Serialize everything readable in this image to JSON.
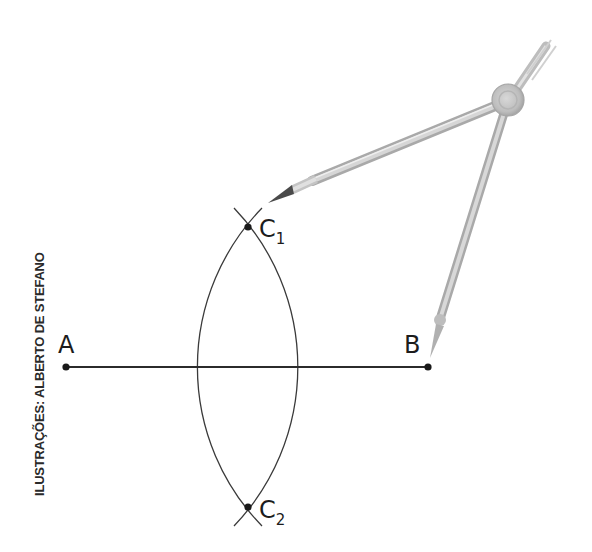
{
  "diagram": {
    "type": "geometric-construction",
    "credit": "ILUSTRAÇÕES: ALBERTO DE STEFANO",
    "colors": {
      "background": "#ffffff",
      "line": "#2b2b2b",
      "arc": "#3a3a3a",
      "point": "#1a1a1a",
      "compass_metal": "#c9c9c9",
      "compass_dark": "#9a9a9a",
      "pencil_lead": "#444444"
    },
    "points": [
      {
        "id": "A",
        "label": "A",
        "subscript": "",
        "x": 66,
        "y": 367
      },
      {
        "id": "B",
        "label": "B",
        "subscript": "",
        "x": 428,
        "y": 367
      },
      {
        "id": "C1",
        "label": "C",
        "subscript": "1",
        "x": 248,
        "y": 227
      },
      {
        "id": "C2",
        "label": "C",
        "subscript": "2",
        "x": 248,
        "y": 507
      }
    ],
    "segment": {
      "from": "A",
      "to": "B"
    },
    "arcs": [
      {
        "center": "A",
        "radius": 230,
        "crosses_segment_x": 295
      },
      {
        "center": "B",
        "radius": 228,
        "crosses_segment_x": 201
      }
    ],
    "compass": {
      "pivot": {
        "x": 508,
        "y": 100
      },
      "pencil_tip": {
        "x": 268,
        "y": 203
      },
      "needle_tip": {
        "x": 430,
        "y": 358
      },
      "needle_knob": {
        "x": 440,
        "y": 318
      },
      "handle_end": {
        "x": 548,
        "y": 44
      }
    }
  }
}
